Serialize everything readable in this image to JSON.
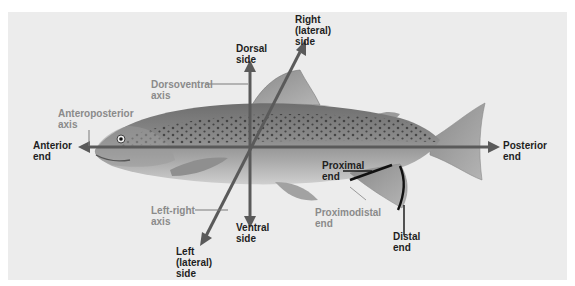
{
  "diagram": {
    "colors": {
      "background": "#ececec",
      "axis_line": "#5a5a5a",
      "dark_label": "#1e1e1e",
      "gray_label": "#8a8a8a",
      "fin_marker": "#111111"
    },
    "labels": {
      "dorsal_side": [
        "Dorsal",
        "side"
      ],
      "right_lateral_side": [
        "Right",
        "(lateral)",
        "side"
      ],
      "dorsoventral_axis": [
        "Dorsoventral",
        "axis"
      ],
      "anteroposterior_axis": [
        "Anteroposterior",
        "axis"
      ],
      "anterior_end": [
        "Anterior",
        "end"
      ],
      "posterior_end": [
        "Posterior",
        "end"
      ],
      "proximal_end": [
        "Proximal",
        "end"
      ],
      "proximodistal_end": [
        "Proximodistal",
        "end"
      ],
      "distal_end": [
        "Distal",
        "end"
      ],
      "left_right_axis": [
        "Left-right",
        "axis"
      ],
      "ventral_side": [
        "Ventral",
        "side"
      ],
      "left_lateral_side": [
        "Left",
        "(lateral)",
        "side"
      ]
    }
  }
}
